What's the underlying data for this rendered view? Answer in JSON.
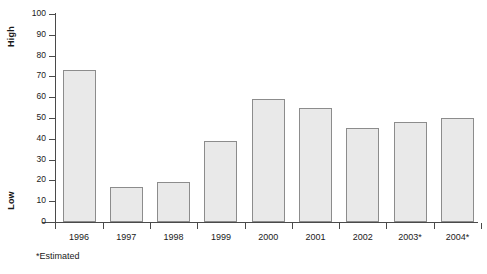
{
  "chart_data": {
    "type": "bar",
    "title": "",
    "subtitle": "",
    "xlabel": "",
    "ylabel": "",
    "categories": [
      "1996",
      "1997",
      "1998",
      "1999",
      "2000",
      "2001",
      "2002",
      "2003*",
      "2004*"
    ],
    "values": [
      73,
      17,
      19,
      39,
      59,
      55,
      45,
      48,
      50
    ],
    "ylim": [
      0,
      100
    ],
    "ytick_labels": [
      "100",
      "90",
      "80",
      "70",
      "60",
      "50",
      "40",
      "30",
      "20",
      "10",
      "0"
    ],
    "ytick_values": [
      100,
      90,
      80,
      70,
      60,
      50,
      40,
      30,
      20,
      10,
      0
    ],
    "ytick_step": 10,
    "grid": false,
    "legend": false,
    "legend_position": "none",
    "annotations": {
      "axis_high_label": "High",
      "axis_low_label": "Low",
      "footnote": "*Estimated"
    },
    "colors": {
      "bar_fill": "#e9e9e9",
      "bar_border": "#8c8c8c",
      "axis": "#4a4a4a",
      "text": "#1a1a1a",
      "background": "#ffffff"
    }
  }
}
